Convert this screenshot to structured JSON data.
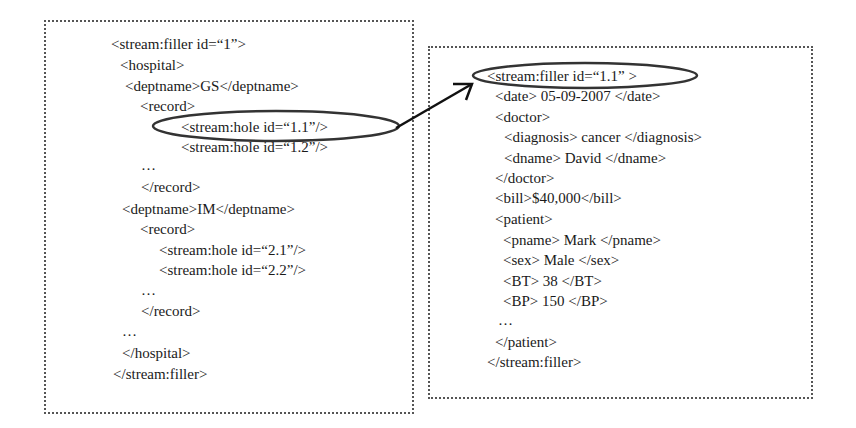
{
  "left_panel": {
    "label": "stream filler 1 (hospital)",
    "lines": [
      {
        "text": "<stream:filler id=“1”>",
        "x": 111,
        "y": 44
      },
      {
        "text": "<hospital>",
        "x": 120,
        "y": 65
      },
      {
        "text": "<deptname>GS</deptname>",
        "x": 125,
        "y": 86
      },
      {
        "text": "<record>",
        "x": 140,
        "y": 106
      },
      {
        "text": "<stream:hole id=“1.1”/>",
        "x": 181,
        "y": 127
      },
      {
        "text": "<stream:hole id=“1.2”/>",
        "x": 181,
        "y": 147
      },
      {
        "text": "…",
        "x": 141,
        "y": 165
      },
      {
        "text": "</record>",
        "x": 141,
        "y": 187
      },
      {
        "text": "<deptname>IM</deptname>",
        "x": 122,
        "y": 209
      },
      {
        "text": "<record>",
        "x": 140,
        "y": 229
      },
      {
        "text": "<stream:hole id=“2.1”/>",
        "x": 159,
        "y": 250
      },
      {
        "text": "<stream:hole id=“2.2”/>",
        "x": 159,
        "y": 270
      },
      {
        "text": "…",
        "x": 141,
        "y": 290
      },
      {
        "text": "</record>",
        "x": 141,
        "y": 311
      },
      {
        "text": "…",
        "x": 122,
        "y": 331
      },
      {
        "text": "</hospital>",
        "x": 122,
        "y": 353
      },
      {
        "text": "</stream:filler>",
        "x": 113,
        "y": 374
      }
    ]
  },
  "right_panel": {
    "label": "stream filler 1.1 (record)",
    "lines": [
      {
        "text": "<stream:filler id=“1.1” >",
        "x": 487,
        "y": 76
      },
      {
        "text": "<date> 05-09-2007 </date>",
        "x": 495,
        "y": 96
      },
      {
        "text": "<doctor>",
        "x": 495,
        "y": 117
      },
      {
        "text": "<diagnosis> cancer </diagnosis>",
        "x": 504,
        "y": 137
      },
      {
        "text": "<dname> David </dname>",
        "x": 504,
        "y": 158
      },
      {
        "text": "</doctor>",
        "x": 495,
        "y": 178
      },
      {
        "text": "<bill>$40,000</bill>",
        "x": 495,
        "y": 198
      },
      {
        "text": "<patient>",
        "x": 495,
        "y": 219
      },
      {
        "text": "<pname> Mark </pname>",
        "x": 503,
        "y": 240
      },
      {
        "text": "<sex> Male </sex>",
        "x": 503,
        "y": 260
      },
      {
        "text": "<BT> 38 </BT>",
        "x": 503,
        "y": 281
      },
      {
        "text": "<BP> 150 </BP>",
        "x": 503,
        "y": 301
      },
      {
        "text": "…",
        "x": 498,
        "y": 320
      },
      {
        "text": "</patient>",
        "x": 495,
        "y": 342
      },
      {
        "text": "</stream:filler>",
        "x": 487,
        "y": 362
      }
    ]
  },
  "connector": {
    "from": "stream:hole id=1.1",
    "to": "stream:filler id=1.1",
    "stroke_color": "#222222"
  },
  "colors": {
    "text": "#1a1a1a",
    "border": "#555555",
    "background": "#ffffff"
  }
}
